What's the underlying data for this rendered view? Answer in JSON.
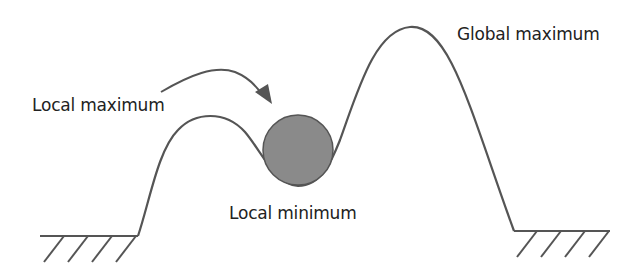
{
  "diagram": {
    "title": "",
    "labels": {
      "local_maximum": "Local maximum",
      "global_maximum": "Global maximum",
      "local_minimum": "Local minimum"
    },
    "colors": {
      "curve": "#555555",
      "ball_fill": "#8a8a8a",
      "ball_stroke": "#555555",
      "text": "#222222",
      "background": "#ffffff"
    },
    "elements": [
      {
        "name": "landscape-curve",
        "type": "path"
      },
      {
        "name": "ball",
        "type": "circle",
        "position": "local minimum"
      },
      {
        "name": "arrow",
        "type": "curved-arrow",
        "from": "local maximum",
        "to": "local minimum"
      },
      {
        "name": "ground-left",
        "type": "hatched-ground"
      },
      {
        "name": "ground-right",
        "type": "hatched-ground"
      }
    ]
  }
}
